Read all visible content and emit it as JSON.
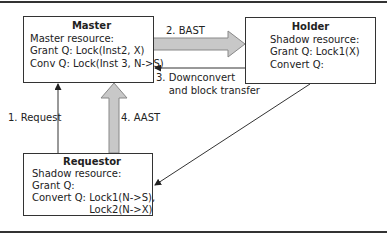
{
  "nodes": {
    "master": {
      "title": "Master",
      "lines": [
        "Master resource:",
        "Grant Q: Lock(Inst2, X)",
        "Conv Q: Lock(Inst 3, N->S)"
      ]
    },
    "holder": {
      "title": "Holder",
      "lines": [
        "Shadow resource:",
        "Grant Q: Lock1(X)",
        "Convert Q:"
      ]
    },
    "requestor": {
      "title": "Requestor",
      "lines": [
        "Shadow resource:",
        "Grant Q:",
        "Convert Q: Lock1(N->S),",
        "                  Lock2(N->X)"
      ]
    }
  },
  "edges": {
    "e1": {
      "label": "1. Request",
      "from": "requestor",
      "to": "master"
    },
    "e2": {
      "label": "2. BAST",
      "from": "master",
      "to": "holder"
    },
    "e3": {
      "label_line1": "3. Downconvert",
      "label_line2": "    and block transfer",
      "from": "holder",
      "to": "master"
    },
    "e4": {
      "label": "4. AAST",
      "from": "requestor",
      "to": "master"
    },
    "e5": {
      "label": "",
      "from": "holder",
      "to": "requestor"
    }
  },
  "colors": {
    "line": "#333333",
    "fat_arrow_fill": "#c8c8c8",
    "fat_arrow_stroke": "#888888"
  }
}
